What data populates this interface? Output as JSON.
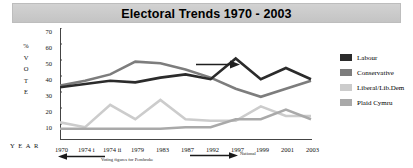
{
  "title": "Electoral Trends 1970 - 2003",
  "axes": {
    "y_label_chars": [
      "%",
      "V",
      "O",
      "T",
      "E"
    ],
    "x_label": "Y E A R"
  },
  "annotations": {
    "left_note": "Voting figures for Pembroke",
    "right_note": "National"
  },
  "legend": {
    "items": [
      {
        "label": "Labour",
        "color": "#2b2b2b"
      },
      {
        "label": "Conservative",
        "color": "#7d7d7d"
      },
      {
        "label": "Liberal/Lib.Dem",
        "color": "#cccccc"
      },
      {
        "label": "Plaid Cymru",
        "color": "#a9a9a9"
      }
    ]
  },
  "chart_data": {
    "type": "line",
    "title": "Electoral Trends 1970 - 2003",
    "xlabel": "Y E A R",
    "ylabel": "% VOTE",
    "categories": [
      "1970",
      "1974 i",
      "1974 ii",
      "1979",
      "1983",
      "1987",
      "1992",
      "1997",
      "1999",
      "2001",
      "2003"
    ],
    "ylim": [
      0,
      70
    ],
    "yticks": [
      10,
      20,
      30,
      40,
      50,
      60,
      70
    ],
    "grid": false,
    "legend_position": "right",
    "series": [
      {
        "name": "Labour",
        "color": "#2b2b2b",
        "values": [
          33,
          35,
          37,
          36,
          39,
          41,
          38,
          51,
          38,
          45,
          38
        ]
      },
      {
        "name": "Conservative",
        "color": "#7d7d7d",
        "values": [
          34,
          37,
          41,
          49,
          48,
          44,
          39,
          32,
          27,
          32,
          37
        ]
      },
      {
        "name": "Liberal/Lib.Dem",
        "color": "#cccccc",
        "values": [
          11,
          8,
          22,
          13,
          25,
          13,
          12,
          12,
          21,
          15,
          15
        ]
      },
      {
        "name": "Plaid Cymru",
        "color": "#a9a9a9",
        "values": [
          7,
          7,
          7,
          7,
          7,
          8,
          8,
          13,
          13,
          19,
          13
        ]
      }
    ],
    "annotations": [
      {
        "text": "Voting figures for Pembroke",
        "span": "1970-1974 i",
        "arrow": "left"
      },
      {
        "text": "National",
        "span": "1987-1992",
        "arrow": "right"
      }
    ]
  }
}
